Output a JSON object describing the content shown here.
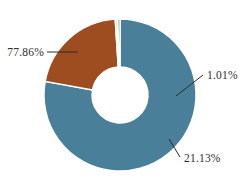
{
  "chart_data": {
    "type": "pie",
    "variant": "donut",
    "title": "",
    "subtitle": "",
    "xlabel": "",
    "ylabel": "",
    "grid": false,
    "legend": "none",
    "label_format": "percent",
    "categories": [
      "Segment 1",
      "Segment 2",
      "Segment 3",
      "Segment 4"
    ],
    "values": [
      77.86,
      21.13,
      0.55,
      0.46
    ],
    "labels": [
      "77.86%",
      "21.13%",
      "1.01%",
      ""
    ],
    "annotations": [
      "77.86%",
      "21.13%",
      "1.01%"
    ],
    "slices": [
      {
        "label": "77.86%",
        "value": 77.86,
        "color": "#4a7f99",
        "label_position": "left",
        "has_leader_line": true
      },
      {
        "label": "21.13%",
        "value": 21.13,
        "color": "#9d4d20",
        "label_position": "bottom-right",
        "has_leader_line": true
      },
      {
        "label": "1.01%",
        "value": 0.55,
        "color": "#efeec8",
        "label_position": "right",
        "has_leader_line": true
      },
      {
        "label": "",
        "value": 0.46,
        "color": "#5f9e3f",
        "label_position": "right",
        "has_leader_line": false
      }
    ],
    "geometry": {
      "center_x": 120,
      "center_y": 95,
      "outer_radius": 76,
      "inner_radius": 28,
      "start_angle_deg": -90,
      "direction": "clockwise"
    },
    "background_color": "#ffffff",
    "label_color": "#2f2f2f"
  },
  "labels": {
    "blue": "77.86%",
    "brown": "21.13%",
    "small": "1.01%"
  }
}
